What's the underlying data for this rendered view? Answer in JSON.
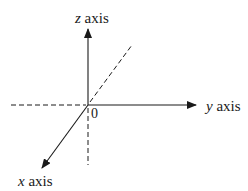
{
  "diagram": {
    "type": "3d-coordinate-axes",
    "origin": {
      "label": "0",
      "x": 88,
      "y": 105
    },
    "colors": {
      "line": "#1a1a1a",
      "background": "#ffffff"
    },
    "axes": [
      {
        "id": "z",
        "variable": "z",
        "word": " axis",
        "direction": "up",
        "positive": "solid",
        "negative": "dashed"
      },
      {
        "id": "y",
        "variable": "y",
        "word": " axis",
        "direction": "right",
        "positive": "solid",
        "negative": "dashed"
      },
      {
        "id": "x",
        "variable": "x",
        "word": " axis",
        "direction": "down-left",
        "positive": "solid",
        "negative": "dashed"
      }
    ]
  }
}
